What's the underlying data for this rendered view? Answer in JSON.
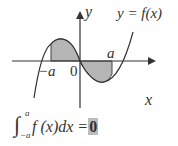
{
  "figure": {
    "y_axis_label": "y",
    "x_axis_label": "x",
    "curve_label": "y = f(x)",
    "origin_label": "0",
    "neg_a_label": "−a",
    "a_label": "a"
  },
  "formula": {
    "integral_sign": "∫",
    "upper_limit": "a",
    "lower_limit": "−a",
    "integrand": "f (x)dx =",
    "result": "0"
  },
  "colors": {
    "shade": "#b5b5b5",
    "line": "#333333",
    "highlight": "#bdbdbd"
  }
}
